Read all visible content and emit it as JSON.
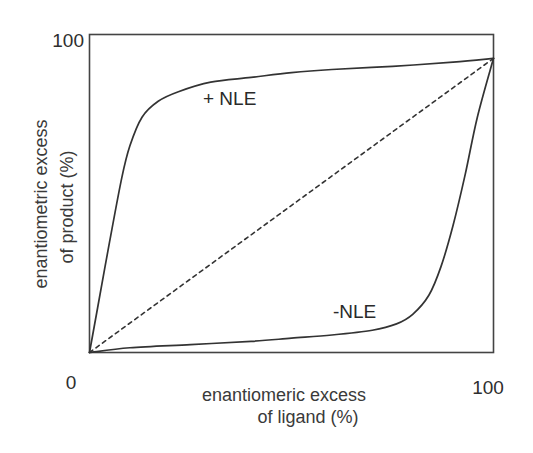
{
  "chart_data": {
    "type": "line",
    "title": "",
    "xlabel": [
      "enantiomeric excess",
      "of ligand (%)"
    ],
    "ylabel": [
      "enantiometric excess",
      "of product (%)"
    ],
    "xlim": [
      0,
      100
    ],
    "ylim": [
      0,
      100
    ],
    "x_ticks": [
      "0",
      "100"
    ],
    "y_ticks": [
      "100"
    ],
    "grid": false,
    "legend": "none (inline annotations)",
    "series": [
      {
        "name": "+ NLE",
        "style": "solid",
        "x": [
          0,
          2,
          5,
          8,
          10,
          13,
          17,
          22,
          30,
          40,
          50,
          60,
          75,
          90,
          100
        ],
        "y": [
          0,
          14,
          35,
          55,
          65,
          74,
          79,
          82,
          85,
          86.5,
          88,
          89,
          90,
          91.3,
          92.5
        ]
      },
      {
        "name": "-NLE",
        "style": "solid",
        "x": [
          0,
          10,
          25,
          40,
          50,
          60,
          70,
          76,
          80,
          84,
          87,
          90,
          93,
          96,
          100
        ],
        "y": [
          0,
          1.5,
          2.5,
          3.5,
          4.5,
          5.5,
          7,
          9,
          12,
          18,
          27,
          40,
          56,
          74,
          92.5
        ]
      },
      {
        "name": "linear (no NLE)",
        "style": "dashed",
        "x": [
          0,
          100
        ],
        "y": [
          0,
          92.5
        ]
      }
    ],
    "annotations": [
      {
        "text": "+ NLE",
        "x": 28,
        "y": 79
      },
      {
        "text": "-NLE",
        "x": 61,
        "y": 12
      }
    ]
  },
  "labels": {
    "y_tick_top": "100",
    "x_tick_left": "0",
    "x_tick_right": "100",
    "xlabel_line1": "enantiomeric excess",
    "xlabel_line2": "of ligand (%)",
    "ylabel_line1": "enantiometric excess",
    "ylabel_line2": "of product (%)",
    "pos_nle": "+ NLE",
    "neg_nle": "-NLE"
  },
  "colors": {
    "stroke": "#333333",
    "frame": "#444444",
    "background": "#ffffff"
  }
}
